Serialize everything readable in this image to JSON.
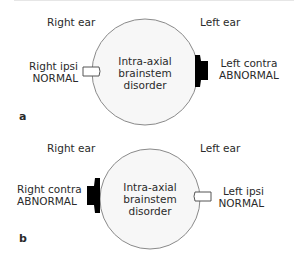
{
  "panels": [
    {
      "letter": "a",
      "right_ear_label": "Right ear",
      "left_ear_label": "Left ear",
      "center_text": [
        "Intra-axial",
        "brainstem",
        "disorder"
      ],
      "right_side": {
        "line1": "Right ipsi",
        "line2": "NORMAL",
        "state": "normal"
      },
      "left_side": {
        "line1": "Left contra",
        "line2": "ABNORMAL",
        "state": "abnormal"
      }
    },
    {
      "letter": "b",
      "right_ear_label": "Right ear",
      "left_ear_label": "Left ear",
      "center_text": [
        "Intra-axial",
        "brainstem",
        "disorder"
      ],
      "right_side": {
        "line1": "Right contra",
        "line2": "ABNORMAL",
        "state": "abnormal"
      },
      "left_side": {
        "line1": "Left ipsi",
        "line2": "NORMAL",
        "state": "normal"
      }
    }
  ],
  "colors": {
    "circle_fill": "#f7f7f7",
    "circle_stroke": "#8a8a8a",
    "abnormal": "#000000",
    "normal_fill": "#ffffff",
    "text": "#2a2a2a"
  }
}
